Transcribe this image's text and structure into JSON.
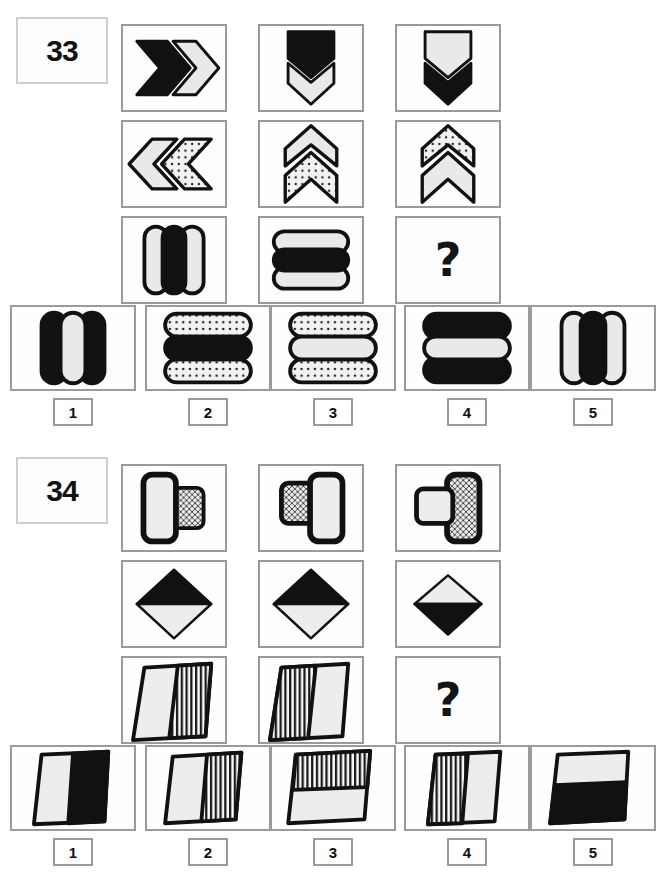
{
  "page": {
    "type": "non-verbal-reasoning-worksheet",
    "width": 659,
    "height": 889,
    "background": "#ffffff",
    "ink": "#111111",
    "light_fill": "#e9e9e9",
    "dotted_fill": "#e2e2e2",
    "frame_color": "#9a9a9a"
  },
  "puzzles": [
    {
      "id": "33",
      "number_label": "33",
      "question_mark": "?",
      "matrix": {
        "rows": 3,
        "cols": 3,
        "cells": [
          {
            "row": 0,
            "col": 0,
            "shape": "double-chevron-right",
            "desc": "Right-pointing chevron pair: left chevron black, right chevron light grey"
          },
          {
            "row": 0,
            "col": 1,
            "shape": "double-chevron-down",
            "desc": "Down-pointing chevron pair: upper chevron black, lower chevron light grey"
          },
          {
            "row": 0,
            "col": 2,
            "shape": "double-chevron-down",
            "desc": "Down-pointing chevron pair: upper chevron light grey, lower chevron black"
          },
          {
            "row": 1,
            "col": 0,
            "shape": "double-chevron-left",
            "desc": "Left-pointing chevron pair: outer chevron light grey, inner chevron dotted"
          },
          {
            "row": 1,
            "col": 1,
            "shape": "double-chevron-up",
            "desc": "Up-pointing chevron pair: upper chevron light grey, lower chevron dotted"
          },
          {
            "row": 1,
            "col": 2,
            "shape": "double-chevron-up",
            "desc": "Up-pointing chevron pair: upper chevron dotted, lower chevron light grey"
          },
          {
            "row": 2,
            "col": 0,
            "shape": "three-vertical-capsules",
            "desc": "Three vertical rounded bars: light, black, light"
          },
          {
            "row": 2,
            "col": 1,
            "shape": "three-horizontal-capsules",
            "desc": "Three horizontal rounded bars: light, black, light"
          },
          {
            "row": 2,
            "col": 2,
            "shape": "question-mark",
            "desc": "Missing element"
          }
        ]
      },
      "options": [
        {
          "label": "1",
          "shape": "three-vertical-capsules",
          "desc": "Three vertical rounded bars: black, light, black"
        },
        {
          "label": "2",
          "shape": "three-horizontal-capsules",
          "desc": "Three horizontal rounded bars: dotted, black, dotted"
        },
        {
          "label": "3",
          "shape": "three-horizontal-capsules",
          "desc": "Three horizontal rounded bars: dotted, light, dotted"
        },
        {
          "label": "4",
          "shape": "three-horizontal-capsules",
          "desc": "Three horizontal rounded bars: black, light, black"
        },
        {
          "label": "5",
          "shape": "three-vertical-capsules",
          "desc": "Three vertical rounded bars: light, black, light"
        }
      ]
    },
    {
      "id": "34",
      "number_label": "34",
      "question_mark": "?",
      "matrix": {
        "rows": 3,
        "cols": 3,
        "cells": [
          {
            "row": 0,
            "col": 0,
            "shape": "two-rounded-rectangles",
            "desc": "Large light rounded rectangle on left overlapping smaller dotted rounded rectangle on right"
          },
          {
            "row": 0,
            "col": 1,
            "shape": "two-rounded-rectangles",
            "desc": "Smaller dotted rounded rectangle on left behind large light rounded rectangle on right"
          },
          {
            "row": 0,
            "col": 2,
            "shape": "two-rounded-rectangles",
            "desc": "Small light rounded rectangle on left in front of large dotted rounded rectangle on right"
          },
          {
            "row": 1,
            "col": 0,
            "shape": "split-diamond",
            "desc": "Diamond, top half black, bottom half light"
          },
          {
            "row": 1,
            "col": 1,
            "shape": "split-diamond",
            "desc": "Diamond, top half black, bottom half light"
          },
          {
            "row": 1,
            "col": 2,
            "shape": "split-diamond",
            "desc": "Diamond, top half light, bottom half black"
          },
          {
            "row": 2,
            "col": 0,
            "shape": "split-parallelogram",
            "desc": "Parallelogram, left half light, right half vertically striped"
          },
          {
            "row": 2,
            "col": 1,
            "shape": "split-parallelogram",
            "desc": "Parallelogram, left half vertically striped, right half light"
          },
          {
            "row": 2,
            "col": 2,
            "shape": "question-mark",
            "desc": "Missing element"
          }
        ]
      },
      "options": [
        {
          "label": "1",
          "shape": "split-parallelogram",
          "desc": "Parallelogram, left half light, right half black"
        },
        {
          "label": "2",
          "shape": "split-parallelogram",
          "desc": "Parallelogram, left half light, right half vertically striped"
        },
        {
          "label": "3",
          "shape": "split-parallelogram",
          "desc": "Parallelogram, top half vertically striped, bottom half light"
        },
        {
          "label": "4",
          "shape": "split-parallelogram",
          "desc": "Parallelogram, left half vertically striped, right half light"
        },
        {
          "label": "5",
          "shape": "split-parallelogram",
          "desc": "Parallelogram, top half light, bottom half black"
        }
      ]
    }
  ]
}
